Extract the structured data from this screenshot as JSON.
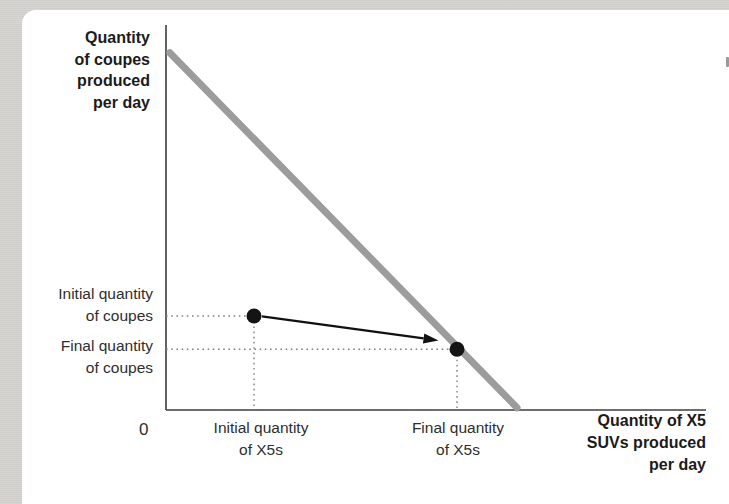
{
  "chart_data": {
    "type": "line",
    "title": "",
    "ylabel": "Quantity of coupes produced per day",
    "xlabel": "Quantity of X5 SUVs produced per day",
    "ylabel_lines": [
      "Quantity",
      "of coupes",
      "produced",
      "per day"
    ],
    "xlabel_lines": [
      "Quantity of X5",
      "SUVs produced",
      "per day"
    ],
    "origin_label": "0",
    "annotations": {
      "initial_coupes_lines": [
        "Initial quantity",
        "of coupes"
      ],
      "final_coupes_lines": [
        "Final quantity",
        "of coupes"
      ],
      "initial_x5_lines": [
        "Initial quantity",
        "of X5s"
      ],
      "final_x5_lines": [
        "Final quantity",
        "of X5s"
      ]
    },
    "axes": {
      "numeric_ticks": false,
      "x_range_frac": [
        0,
        1
      ],
      "y_range_frac": [
        0,
        1
      ],
      "grid": false,
      "legend": "none"
    },
    "series": [
      {
        "name": "production-possibilities-frontier",
        "points_frac": [
          [
            0.007,
            0.9278
          ],
          [
            0.65,
            0.006
          ]
        ]
      }
    ],
    "points": [
      {
        "name": "initial-point",
        "frac": [
          0.163,
          0.2442
        ],
        "x_label": "Initial quantity of X5s",
        "y_label": "Initial quantity of coupes"
      },
      {
        "name": "final-point",
        "frac": [
          0.5389,
          0.1577
        ],
        "x_label": "Final quantity of X5s",
        "y_label": "Final quantity of coupes"
      }
    ],
    "arrow": {
      "from_frac": [
        0.1778,
        0.2429
      ],
      "to_frac": [
        0.5046,
        0.1805
      ]
    },
    "colors": {
      "page_bg": "#d5d4d1",
      "card_bg": "#ffffff",
      "axis": "#3c3c3c",
      "frontier": "#9c9c9c",
      "point": "#141414",
      "arrow": "#111111",
      "dotted": "#818181",
      "text": "#2e2e2e",
      "text_bold": "#1b1b1b"
    },
    "layout": {
      "plot_box": {
        "x": 166,
        "y": 25,
        "w": 540,
        "h": 385
      },
      "axis_width": 1.6,
      "frontier_width": 7,
      "point_radius": 7.5,
      "dotted_width": 1.4,
      "dotted_dash": "1.6 3.6",
      "arrow_line_width": 2.3,
      "arrow_head_length": 15,
      "arrow_head_half_width": 5
    }
  }
}
